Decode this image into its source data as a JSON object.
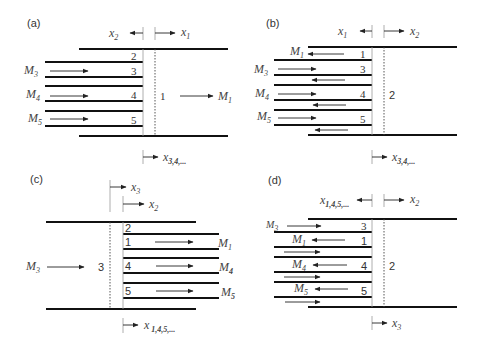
{
  "figure": {
    "panels": [
      {
        "id": "a",
        "label": "(a)",
        "top_labels": {
          "left": "x",
          "left_sub": "2",
          "right": "x",
          "right_sub": "1"
        },
        "bottom_label": {
          "text": "x",
          "sub": "3,4,..."
        },
        "region_center": "1",
        "right_mass": {
          "text": "M",
          "sub": "1"
        },
        "layers": [
          "2",
          "3",
          "4",
          "5"
        ],
        "masses": [
          {
            "text": "M",
            "sub": "3"
          },
          {
            "text": "M",
            "sub": "4"
          },
          {
            "text": "M",
            "sub": "5"
          }
        ]
      },
      {
        "id": "b",
        "label": "(b)",
        "top_labels": {
          "left": "x",
          "left_sub": "1",
          "right": "x",
          "right_sub": "2"
        },
        "bottom_label": {
          "text": "x",
          "sub": "3,4,..."
        },
        "region_center": "2",
        "layers": [
          "1",
          "3",
          "4",
          "5"
        ],
        "masses": [
          {
            "text": "M",
            "sub": "1"
          },
          {
            "text": "M",
            "sub": "3"
          },
          {
            "text": "M",
            "sub": "4"
          },
          {
            "text": "M",
            "sub": "5"
          }
        ]
      },
      {
        "id": "c",
        "label": "(c)",
        "top_labels": {
          "upper": "x",
          "upper_sub": "3",
          "lower": "x",
          "lower_sub": "2"
        },
        "bottom_label": {
          "text": "x",
          "sub": "1,4,5,..."
        },
        "region_center": "3",
        "left_mass": {
          "text": "M",
          "sub": "3"
        },
        "layers": [
          "2",
          "1",
          "4",
          "5"
        ],
        "masses": [
          {
            "text": "M",
            "sub": "1"
          },
          {
            "text": "M",
            "sub": "4"
          },
          {
            "text": "M",
            "sub": "5"
          }
        ]
      },
      {
        "id": "d",
        "label": "(d)",
        "top_labels": {
          "left": "x",
          "left_sub": "1,4,5,...",
          "right": "x",
          "right_sub": "2"
        },
        "bottom_label": {
          "text": "x",
          "sub": "3"
        },
        "region_center": "2",
        "layers": [
          "3",
          "1",
          "4",
          "5"
        ],
        "masses": [
          {
            "text": "M",
            "sub": "3"
          },
          {
            "text": "M",
            "sub": "1"
          },
          {
            "text": "M",
            "sub": "4"
          },
          {
            "text": "M",
            "sub": "5"
          }
        ]
      }
    ]
  }
}
